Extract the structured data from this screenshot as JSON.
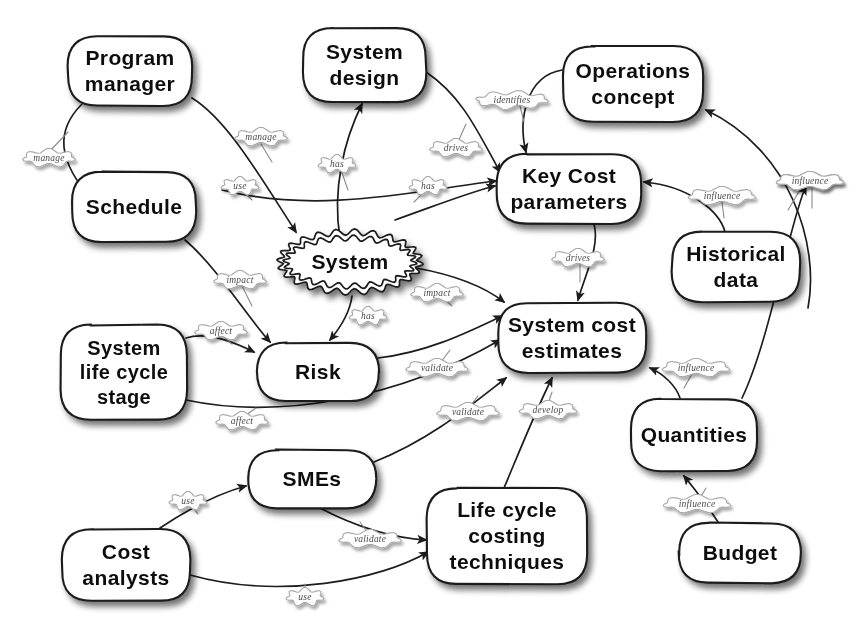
{
  "diagram": {
    "style": "hand-drawn concept map",
    "background_color": "#ffffff",
    "node_fill": "#ffffff",
    "node_stroke": "#1a1a1a",
    "edge_color": "#1d1d1d",
    "edge_label_color": "#4a4a4a"
  },
  "nodes": [
    {
      "id": "program_manager",
      "label_lines": [
        "Program",
        "manager"
      ],
      "shape": "rounded-rect",
      "x": 68,
      "y": 36,
      "w": 124,
      "h": 70,
      "font_size": 21
    },
    {
      "id": "system_design",
      "label_lines": [
        "System",
        "design"
      ],
      "shape": "rounded-rect",
      "x": 303,
      "y": 28,
      "w": 123,
      "h": 74,
      "font_size": 21
    },
    {
      "id": "operations_concept",
      "label_lines": [
        "Operations",
        "concept"
      ],
      "shape": "rounded-rect",
      "x": 563,
      "y": 46,
      "w": 140,
      "h": 76,
      "font_size": 21
    },
    {
      "id": "schedule",
      "label_lines": [
        "Schedule"
      ],
      "shape": "rounded-rect",
      "x": 72,
      "y": 172,
      "w": 124,
      "h": 70,
      "font_size": 21
    },
    {
      "id": "key_cost_parameters",
      "label_lines": [
        "Key Cost",
        "parameters"
      ],
      "shape": "rounded-rect",
      "x": 497,
      "y": 154,
      "w": 144,
      "h": 70,
      "font_size": 21
    },
    {
      "id": "historical_data",
      "label_lines": [
        "Historical",
        "data"
      ],
      "shape": "rounded-rect",
      "x": 672,
      "y": 232,
      "w": 128,
      "h": 70,
      "font_size": 21
    },
    {
      "id": "system",
      "label_lines": [
        "System"
      ],
      "shape": "scalloped-ellipse",
      "x": 278,
      "y": 230,
      "w": 144,
      "h": 64,
      "font_size": 21
    },
    {
      "id": "system_life_cycle_stage",
      "label_lines": [
        "System",
        "life cycle",
        "stage"
      ],
      "shape": "rounded-rect",
      "x": 61,
      "y": 325,
      "w": 126,
      "h": 95,
      "font_size": 20
    },
    {
      "id": "risk",
      "label_lines": [
        "Risk"
      ],
      "shape": "rounded-rect",
      "x": 257,
      "y": 343,
      "w": 122,
      "h": 58,
      "font_size": 21
    },
    {
      "id": "system_cost_estimates",
      "label_lines": [
        "System cost",
        "estimates"
      ],
      "shape": "rounded-rect",
      "x": 498,
      "y": 303,
      "w": 148,
      "h": 70,
      "font_size": 21
    },
    {
      "id": "quantities",
      "label_lines": [
        "Quantities"
      ],
      "shape": "rounded-rect",
      "x": 631,
      "y": 399,
      "w": 126,
      "h": 72,
      "font_size": 21
    },
    {
      "id": "smes",
      "label_lines": [
        "SMEs"
      ],
      "shape": "rounded-rect",
      "x": 248,
      "y": 450,
      "w": 128,
      "h": 58,
      "font_size": 21
    },
    {
      "id": "life_cycle_costing_techniques",
      "label_lines": [
        "Life cycle",
        "costing",
        "techniques"
      ],
      "shape": "rounded-rect",
      "x": 427,
      "y": 488,
      "w": 160,
      "h": 96,
      "font_size": 21
    },
    {
      "id": "cost_analysts",
      "label_lines": [
        "Cost",
        "analysts"
      ],
      "shape": "rounded-rect",
      "x": 62,
      "y": 529,
      "w": 128,
      "h": 72,
      "font_size": 21
    },
    {
      "id": "budget",
      "label_lines": [
        "Budget"
      ],
      "shape": "rounded-rect",
      "x": 679,
      "y": 523,
      "w": 122,
      "h": 60,
      "font_size": 21
    }
  ],
  "edges": [
    {
      "id": "pm_manages_schedule",
      "label": "manage",
      "from": "program_manager",
      "to": "schedule",
      "path": "M 82,104 C 56,130 56,160 94,202",
      "label_x": 49,
      "label_y": 158,
      "stem": "M 49,152 L 68,132"
    },
    {
      "id": "pm_manages_system",
      "label": "manage",
      "from": "program_manager",
      "to": "system",
      "path": "M 192,98 C 228,120 262,180 296,232",
      "label_x": 261,
      "label_y": 137,
      "stem": "M 261,144 L 272,162"
    },
    {
      "id": "system_design_has_system",
      "label": "has",
      "from": "system_design",
      "to": "system_design_src",
      "path": "M 340,238 C 332,190 344,140 362,104",
      "label_x": 337,
      "label_y": 164,
      "stem": "M 341,170 L 348,190"
    },
    {
      "id": "system_design_drives_kcp",
      "label": "drives",
      "from": "system_design",
      "to": "key_cost_parameters",
      "path": "M 426,72 C 462,96 478,132 500,172",
      "label_x": 456,
      "label_y": 148,
      "stem": "M 458,142 L 466,124"
    },
    {
      "id": "operations_identifies_kcp",
      "label": "identifies",
      "from": "operations_concept",
      "to": "key_cost_parameters",
      "path": "M 562,70 C 526,76 518,120 526,152",
      "label_x": 512,
      "label_y": 100,
      "stem": "M 520,106 L 524,122"
    },
    {
      "id": "smes_use_kcp",
      "label": "use",
      "from": "smes",
      "to": "key_cost_parameters",
      "path": "M 222,190 C 320,215 420,190 496,181",
      "label_x": 240,
      "label_y": 186,
      "stem": "M 244,192 L 252,200"
    },
    {
      "id": "system_has_kcp",
      "label": "has",
      "from": "system",
      "to": "key_cost_parameters",
      "path": "M 395,220 C 440,204 470,192 495,186",
      "label_x": 428,
      "label_y": 186,
      "stem": "M 424,192 L 414,202"
    },
    {
      "id": "kcp_drives_sce",
      "label": "drives",
      "from": "key_cost_parameters",
      "to": "system_cost_estimates",
      "path": "M 594,224 C 600,246 586,272 578,300",
      "label_x": 578,
      "label_y": 258,
      "stem": "M 580,264 L 580,282"
    },
    {
      "id": "historical_influences_kcp",
      "label": "influence",
      "from": "historical_data",
      "to": "key_cost_parameters",
      "path": "M 725,232 C 720,212 690,186 644,182",
      "label_x": 722,
      "label_y": 196,
      "stem": "M 722,202 L 724,218"
    },
    {
      "id": "budget_influences_operations",
      "label": "influence",
      "from": "budget_right",
      "to": "operations_concept",
      "path": "M 808,308 C 820,244 790,150 706,110",
      "label_x": 810,
      "label_y": 181,
      "stem": "M 812,188 L 812,208"
    },
    {
      "id": "schedule_impacts_risk",
      "label": "impact",
      "from": "schedule",
      "to": "risk",
      "path": "M 185,240 C 216,266 248,318 270,342",
      "label_x": 240,
      "label_y": 280,
      "stem": "M 242,286 L 252,306"
    },
    {
      "id": "slcs_affects_risk",
      "label": "affect",
      "from": "system_life_cycle_stage",
      "to": "risk",
      "path": "M 186,338 C 204,332 230,340 254,352",
      "label_x": 221,
      "label_y": 331,
      "stem": "M 224,337 L 232,344"
    },
    {
      "id": "system_has_risk",
      "label": "has",
      "from": "system",
      "to": "risk",
      "path": "M 352,296 C 350,312 340,328 330,340",
      "label_x": 368,
      "label_y": 316,
      "stem": "M 362,320 L 352,312"
    },
    {
      "id": "system_impacts_sce",
      "label": "impact",
      "from": "system",
      "to": "system_cost_estimates",
      "path": "M 416,268 C 460,276 486,288 504,302",
      "label_x": 437,
      "label_y": 293,
      "stem": "M 443,298 L 452,306"
    },
    {
      "id": "risk_validate_sce",
      "label": "validate",
      "from": "risk",
      "to": "system_cost_estimates",
      "path": "M 378,358 C 430,352 472,330 502,316",
      "label_x": 437,
      "label_y": 368,
      "stem": "M 441,362 L 450,350"
    },
    {
      "id": "slcs_affects_sce",
      "label": "affect",
      "from": "system_life_cycle_stage",
      "to": "system_cost_estimates",
      "path": "M 186,400 C 280,420 400,398 500,340",
      "label_x": 242,
      "label_y": 421,
      "stem": "M 246,415 L 256,408"
    },
    {
      "id": "smes_validate_sce",
      "label": "validate",
      "from": "smes",
      "to": "system_cost_estimates",
      "path": "M 374,462 C 430,440 470,406 506,378",
      "label_x": 468,
      "label_y": 412,
      "stem": "M 470,406 L 478,396"
    },
    {
      "id": "lcct_develop_sce",
      "label": "develop",
      "from": "life_cycle_costing_techniques",
      "to": "system_cost_estimates",
      "path": "M 504,488 C 520,450 536,410 552,378",
      "label_x": 548,
      "label_y": 410,
      "stem": "M 548,404 L 552,392"
    },
    {
      "id": "quantities_influence_sce",
      "label": "influence",
      "from": "quantities",
      "to": "system_cost_estimates",
      "path": "M 680,398 C 676,386 664,374 650,368",
      "label_x": 696,
      "label_y": 368,
      "stem": "M 692,374 L 684,388"
    },
    {
      "id": "quantities_influence_operations",
      "label": "influence",
      "from": "quantities",
      "to": "operations_concept",
      "path": "M 742,398 C 770,340 790,220 806,186",
      "label_x": 810,
      "label_y": 181,
      "stem": "M 800,190 L 788,210"
    },
    {
      "id": "budget_influences_quantities",
      "label": "influence",
      "from": "budget",
      "to": "quantities",
      "path": "M 718,522 C 706,504 694,488 684,476",
      "label_x": 697,
      "label_y": 504,
      "stem": "M 700,498 L 706,488"
    },
    {
      "id": "cost_analysts_use_smes",
      "label": "use",
      "from": "cost_analysts",
      "to": "smes",
      "path": "M 160,528 C 190,508 216,494 246,486",
      "label_x": 188,
      "label_y": 501,
      "stem": "M 192,506 L 198,514"
    },
    {
      "id": "smes_validate_lcct",
      "label": "validate",
      "from": "smes",
      "to": "life_cycle_costing_techniques",
      "path": "M 320,508 C 358,528 396,538 426,540",
      "label_x": 370,
      "label_y": 539,
      "stem": "M 368,533 L 360,522"
    },
    {
      "id": "cost_analysts_use_lcct",
      "label": "use",
      "from": "cost_analysts",
      "to": "life_cycle_costing_techniques",
      "path": "M 190,575 C 280,600 380,580 428,552",
      "label_x": 305,
      "label_y": 597,
      "stem": "M 305,591 L 305,584"
    }
  ],
  "edge_label_texts": {
    "manage": "manage",
    "use": "use",
    "has": "has",
    "drives": "drives",
    "identifies": "identifies",
    "influence": "influence",
    "impact": "impact",
    "affect": "affect",
    "validate": "validate",
    "develop": "develop"
  }
}
